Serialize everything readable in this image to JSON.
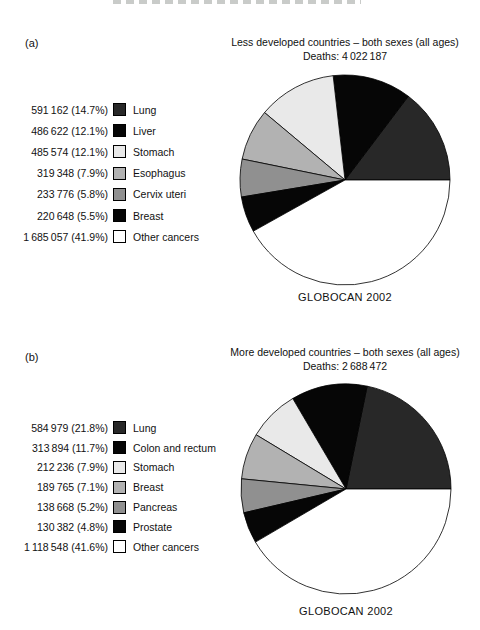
{
  "figure": {
    "source_label": "GLOBOCAN 2002",
    "colors": {
      "dark_gray": "#282828",
      "black": "#060606",
      "light_gray": "#e9e9e9",
      "mid_light_gray": "#b2b2b2",
      "mid_gray": "#909090",
      "white": "#ffffff"
    }
  },
  "charts": [
    {
      "panel_label": "(a)",
      "title": "Less developed countries – both sexes (all ages)",
      "subtitle": "Deaths: 4 022 187",
      "source": "GLOBOCAN 2002",
      "chart_data": {
        "type": "pie",
        "title": "Less developed countries - both sexes (all ages)",
        "total_deaths": 4022187,
        "legend_position": "left",
        "start_angle_deg": 90,
        "direction": "counterclockwise",
        "slices": [
          {
            "label": "Lung",
            "deaths": 591162,
            "percent": 14.7,
            "value_text": "591 162 (14.7%)",
            "color": "#282828"
          },
          {
            "label": "Liver",
            "deaths": 486622,
            "percent": 12.1,
            "value_text": "486 622 (12.1%)",
            "color": "#060606"
          },
          {
            "label": "Stomach",
            "deaths": 485574,
            "percent": 12.1,
            "value_text": "485 574 (12.1%)",
            "color": "#e9e9e9"
          },
          {
            "label": "Esophagus",
            "deaths": 319348,
            "percent": 7.9,
            "value_text": "319 348 (7.9%)",
            "color": "#b2b2b2"
          },
          {
            "label": "Cervix uteri",
            "deaths": 233776,
            "percent": 5.8,
            "value_text": "233 776 (5.8%)",
            "color": "#909090"
          },
          {
            "label": "Breast",
            "deaths": 220648,
            "percent": 5.5,
            "value_text": "220 648 (5.5%)",
            "color": "#060606"
          },
          {
            "label": "Other cancers",
            "deaths": 1685057,
            "percent": 41.9,
            "value_text": "1 685 057 (41.9%)",
            "color": "#ffffff"
          }
        ]
      }
    },
    {
      "panel_label": "(b)",
      "title": "More developed countries – both sexes (all ages)",
      "subtitle": "Deaths: 2 688 472",
      "source": "GLOBOCAN 2002",
      "chart_data": {
        "type": "pie",
        "title": "More developed countries - both sexes (all ages)",
        "total_deaths": 2688472,
        "legend_position": "left",
        "start_angle_deg": 90,
        "direction": "counterclockwise",
        "slices": [
          {
            "label": "Lung",
            "deaths": 584979,
            "percent": 21.8,
            "value_text": "584 979 (21.8%)",
            "color": "#282828"
          },
          {
            "label": "Colon and rectum",
            "deaths": 313894,
            "percent": 11.7,
            "value_text": "313 894 (11.7%)",
            "color": "#060606"
          },
          {
            "label": "Stomach",
            "deaths": 212236,
            "percent": 7.9,
            "value_text": "212 236 (7.9%)",
            "color": "#e9e9e9"
          },
          {
            "label": "Breast",
            "deaths": 189765,
            "percent": 7.1,
            "value_text": "189 765 (7.1%)",
            "color": "#b2b2b2"
          },
          {
            "label": "Pancreas",
            "deaths": 138668,
            "percent": 5.2,
            "value_text": "138 668 (5.2%)",
            "color": "#909090"
          },
          {
            "label": "Prostate",
            "deaths": 130382,
            "percent": 4.8,
            "value_text": "130 382 (4.8%)",
            "color": "#060606"
          },
          {
            "label": "Other cancers",
            "deaths": 1118548,
            "percent": 41.6,
            "value_text": "1 118 548 (41.6%)",
            "color": "#ffffff"
          }
        ]
      }
    }
  ]
}
